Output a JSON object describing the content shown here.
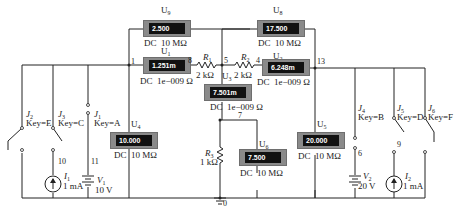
{
  "meters": [
    {
      "id": "U9",
      "name": "U",
      "sub": "9",
      "reading": "2.500",
      "mode": "DC",
      "param": "10 MΩ"
    },
    {
      "id": "U8",
      "name": "U",
      "sub": "8",
      "reading": "17.500",
      "mode": "DC",
      "param": "10 MΩ"
    },
    {
      "id": "U1",
      "name": "U",
      "sub": "1",
      "reading": "1.251m",
      "mode": "DC",
      "param": "1e−009 Ω"
    },
    {
      "id": "U2",
      "name": "U",
      "sub": "2",
      "reading": "6.248m",
      "mode": "DC",
      "param": "1e−009 Ω"
    },
    {
      "id": "U3",
      "name": "U",
      "sub": "3",
      "reading": "7.501m",
      "mode": "DC",
      "param": "1e−009 Ω"
    },
    {
      "id": "U4",
      "name": "U",
      "sub": "4",
      "reading": "10.000",
      "mode": "DC",
      "param": "10 MΩ"
    },
    {
      "id": "U6",
      "name": "U",
      "sub": "6",
      "reading": "7.500",
      "mode": "DC",
      "param": "10 MΩ"
    },
    {
      "id": "U5",
      "name": "U",
      "sub": "5",
      "reading": "20.000",
      "mode": "DC",
      "param": "10 MΩ"
    }
  ],
  "resistors": [
    {
      "id": "R1",
      "name": "R",
      "sub": "1",
      "value": "2 kΩ"
    },
    {
      "id": "R2",
      "name": "R",
      "sub": "2",
      "value": "2 kΩ"
    },
    {
      "id": "R3",
      "name": "R",
      "sub": "3",
      "value": "1 kΩ"
    }
  ],
  "switches": [
    {
      "id": "J2",
      "name": "J",
      "sub": "2",
      "key": "Key=E"
    },
    {
      "id": "J3",
      "name": "J",
      "sub": "3",
      "key": "Key=C"
    },
    {
      "id": "J1",
      "name": "J",
      "sub": "1",
      "key": "Key=A"
    },
    {
      "id": "J4",
      "name": "J",
      "sub": "4",
      "key": "Key=B"
    },
    {
      "id": "J5",
      "name": "J",
      "sub": "5",
      "key": "Key=D"
    },
    {
      "id": "J6",
      "name": "J",
      "sub": "6",
      "key": "Key=F"
    }
  ],
  "sources": [
    {
      "id": "I1",
      "name": "I",
      "sub": "1",
      "value": "1 mA"
    },
    {
      "id": "V1",
      "name": "V",
      "sub": "1",
      "value": "10 V"
    },
    {
      "id": "V2",
      "name": "V",
      "sub": "2",
      "value": "20 V"
    },
    {
      "id": "I2",
      "name": "I",
      "sub": "2",
      "value": "1 mA"
    }
  ],
  "nodes": {
    "n1": "1",
    "n8": "8",
    "n5": "5",
    "n4": "4",
    "n13": "13",
    "n10": "10",
    "n11": "11",
    "n7": "7",
    "n6": "6",
    "n9": "9",
    "n0": "0"
  }
}
